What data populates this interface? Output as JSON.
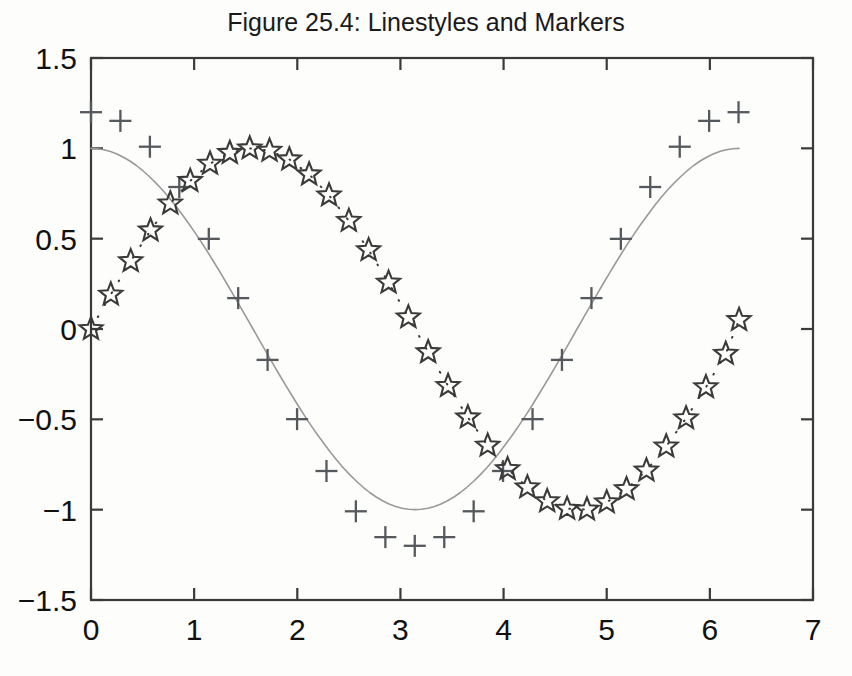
{
  "chart_data": {
    "type": "line",
    "title": "Figure 25.4: Linestyles and Markers",
    "xlabel": "",
    "ylabel": "",
    "xlim": [
      0,
      7
    ],
    "ylim": [
      -1.5,
      1.5
    ],
    "xticks": [
      0,
      1,
      2,
      3,
      4,
      5,
      6,
      7
    ],
    "yticks": [
      -1.5,
      -1,
      -0.5,
      0,
      0.5,
      1,
      1.5
    ],
    "xticklabels": [
      "0",
      "1",
      "2",
      "3",
      "4",
      "5",
      "6",
      "7"
    ],
    "yticklabels": [
      "-1.5",
      "-1",
      "-0.5",
      "0",
      "0.5",
      "1",
      "1.5"
    ],
    "grid": false,
    "legend": "none",
    "box": true,
    "series": [
      {
        "name": "cos(x)",
        "style": "solid-line",
        "marker": "none",
        "color": "#9a9a9a",
        "linewidth": 1.6,
        "x": [
          0,
          0.063,
          0.126,
          0.189,
          0.251,
          0.314,
          0.377,
          0.44,
          0.503,
          0.565,
          0.628,
          0.691,
          0.754,
          0.817,
          0.88,
          0.942,
          1.005,
          1.068,
          1.131,
          1.194,
          1.257,
          1.319,
          1.382,
          1.445,
          1.508,
          1.571,
          1.634,
          1.696,
          1.759,
          1.822,
          1.885,
          1.948,
          2.011,
          2.073,
          2.136,
          2.199,
          2.262,
          2.325,
          2.388,
          2.45,
          2.513,
          2.576,
          2.639,
          2.702,
          2.765,
          2.827,
          2.89,
          2.953,
          3.016,
          3.079,
          3.142,
          3.204,
          3.267,
          3.33,
          3.393,
          3.456,
          3.519,
          3.581,
          3.644,
          3.707,
          3.77,
          3.833,
          3.896,
          3.958,
          4.021,
          4.084,
          4.147,
          4.21,
          4.273,
          4.335,
          4.398,
          4.461,
          4.524,
          4.587,
          4.65,
          4.712,
          4.775,
          4.838,
          4.901,
          4.964,
          5.027,
          5.089,
          5.152,
          5.215,
          5.278,
          5.341,
          5.404,
          5.466,
          5.529,
          5.592,
          5.655,
          5.718,
          5.781,
          5.843,
          5.906,
          5.969,
          6.032,
          6.095,
          6.158,
          6.22,
          6.283
        ],
        "y": [
          1.0,
          0.998,
          0.992,
          0.982,
          0.969,
          0.951,
          0.93,
          0.905,
          0.876,
          0.844,
          0.809,
          0.771,
          0.729,
          0.685,
          0.637,
          0.588,
          0.536,
          0.482,
          0.426,
          0.368,
          0.309,
          0.249,
          0.187,
          0.125,
          0.063,
          0.0,
          -0.063,
          -0.125,
          -0.187,
          -0.249,
          -0.309,
          -0.368,
          -0.426,
          -0.482,
          -0.536,
          -0.588,
          -0.637,
          -0.685,
          -0.729,
          -0.771,
          -0.809,
          -0.844,
          -0.876,
          -0.905,
          -0.93,
          -0.951,
          -0.969,
          -0.982,
          -0.992,
          -0.998,
          -1.0,
          -0.998,
          -0.992,
          -0.982,
          -0.969,
          -0.951,
          -0.93,
          -0.905,
          -0.876,
          -0.844,
          -0.809,
          -0.771,
          -0.729,
          -0.685,
          -0.637,
          -0.588,
          -0.536,
          -0.482,
          -0.426,
          -0.368,
          -0.309,
          -0.249,
          -0.187,
          -0.125,
          -0.063,
          0.0,
          0.063,
          0.125,
          0.187,
          0.249,
          0.309,
          0.368,
          0.426,
          0.482,
          0.536,
          0.588,
          0.637,
          0.685,
          0.729,
          0.771,
          0.809,
          0.844,
          0.876,
          0.905,
          0.93,
          0.951,
          0.969,
          0.982,
          0.992,
          0.998,
          1.0
        ],
        "note": "smooth solid gray curve, no markers, amplitude 1"
      },
      {
        "name": "1.2*cos(x)",
        "style": "no-line",
        "marker": "plus",
        "color": "#55585c",
        "x": [
          0,
          0.285,
          0.571,
          0.856,
          1.142,
          1.427,
          1.712,
          1.998,
          2.283,
          2.568,
          2.854,
          3.139,
          3.425,
          3.71,
          3.995,
          4.281,
          4.566,
          4.852,
          5.137,
          5.422,
          5.708,
          5.993,
          6.278
        ],
        "y": [
          1.2,
          1.152,
          1.009,
          0.786,
          0.499,
          0.171,
          -0.171,
          -0.499,
          -0.786,
          -1.009,
          -1.152,
          -1.2,
          -1.152,
          -1.009,
          -0.786,
          -0.499,
          -0.171,
          0.171,
          0.499,
          0.786,
          1.009,
          1.152,
          1.2
        ],
        "note": "plus markers only, amplitude 1.2"
      },
      {
        "name": "sin(x)",
        "style": "dotted-line",
        "marker": "pentagram-star",
        "color": "#3a3a3a",
        "x": [
          0,
          0.192,
          0.385,
          0.577,
          0.769,
          0.962,
          1.154,
          1.346,
          1.539,
          1.731,
          1.923,
          2.115,
          2.308,
          2.5,
          2.692,
          2.885,
          3.077,
          3.269,
          3.462,
          3.654,
          3.846,
          4.039,
          4.231,
          4.423,
          4.616,
          4.808,
          5.0,
          5.192,
          5.385,
          5.577,
          5.769,
          5.962,
          6.154,
          6.283
        ],
        "y": [
          0,
          0.191,
          0.376,
          0.546,
          0.695,
          0.82,
          0.915,
          0.975,
          1.0,
          0.987,
          0.939,
          0.856,
          0.74,
          0.599,
          0.437,
          0.257,
          0.065,
          -0.128,
          -0.315,
          -0.489,
          -0.645,
          -0.775,
          -0.876,
          -0.953,
          -0.995,
          -0.999,
          -0.959,
          -0.886,
          -0.783,
          -0.65,
          -0.494,
          -0.322,
          -0.137,
          0.05
        ],
        "note": "hollow star markers joined by fine dotted line, amplitude 1"
      }
    ]
  },
  "axes": {
    "plot_box_px": {
      "left": 91,
      "top": 58,
      "right": 813,
      "bottom": 600
    },
    "axis_color": "#3a3a3a",
    "background": "#fdfdfc"
  }
}
